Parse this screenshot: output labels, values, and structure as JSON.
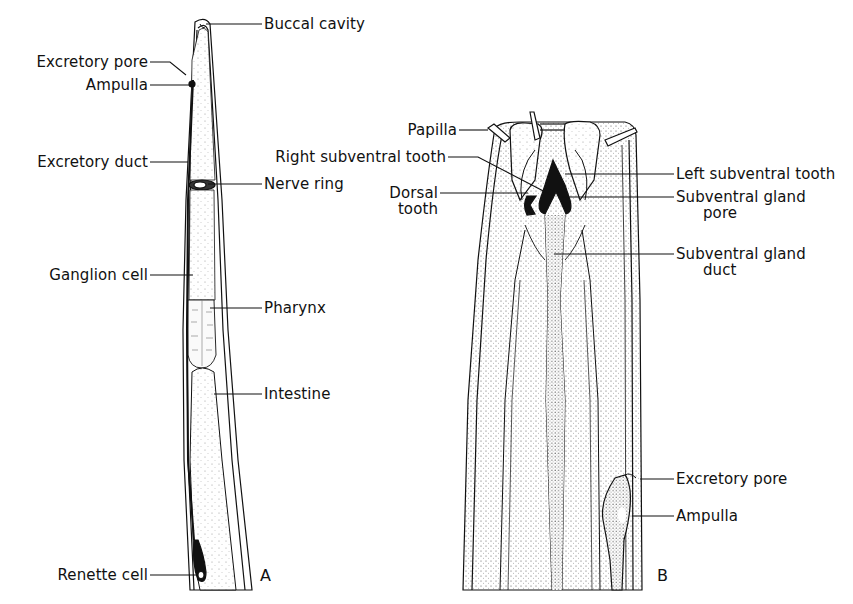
{
  "figure": {
    "panels": [
      {
        "id": "A",
        "label": "A",
        "labels": {
          "buccal_cavity": "Buccal cavity",
          "excretory_pore": "Excretory pore",
          "ampulla": "Ampulla",
          "excretory_duct": "Excretory duct",
          "nerve_ring": "Nerve ring",
          "ganglion_cell": "Ganglion cell",
          "pharynx": "Pharynx",
          "intestine": "Intestine",
          "renette_cell": "Renette cell"
        }
      },
      {
        "id": "B",
        "label": "B",
        "labels": {
          "papilla": "Papilla",
          "right_subventral_tooth": "Right subventral tooth",
          "dorsal_tooth_1": "Dorsal",
          "dorsal_tooth_2": "tooth",
          "left_subventral_tooth": "Left subventral tooth",
          "subventral_gland_pore_1": "Subventral  gland",
          "subventral_gland_pore_2": "pore",
          "subventral_gland_duct_1": "Subventral  gland",
          "subventral_gland_duct_2": "duct",
          "excretory_pore": "Excretory pore",
          "ampulla": "Ampulla"
        }
      }
    ],
    "colors": {
      "ink": "#111111",
      "stipple": "#d9d9d9",
      "background": "#ffffff"
    }
  }
}
